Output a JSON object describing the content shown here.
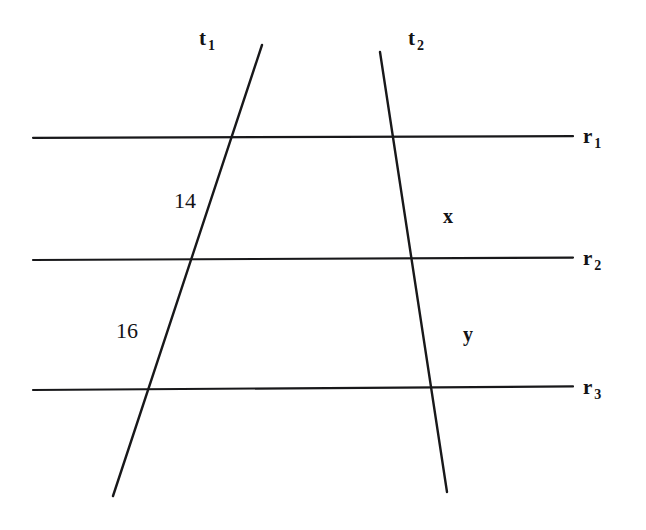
{
  "figure": {
    "background_color": "#ffffff",
    "stroke_color": "#18181a",
    "width": 646,
    "height": 530,
    "parallel_lines": [
      {
        "id": "r1",
        "label_base": "r",
        "label_sub": "1",
        "y": 137,
        "x_start": 33,
        "x_end": 573,
        "label_x": 583,
        "label_y": 126
      },
      {
        "id": "r2",
        "label_base": "r",
        "label_sub": "2",
        "y": 259,
        "x_start": 33,
        "x_end": 573,
        "label_x": 583,
        "label_y": 248
      },
      {
        "id": "r3",
        "label_base": "r",
        "label_sub": "3",
        "y": 388,
        "x_start": 33,
        "x_end": 573,
        "label_x": 583,
        "label_y": 377
      }
    ],
    "transversals": [
      {
        "id": "t1",
        "label_base": "t",
        "label_sub": "1",
        "x1": 262,
        "y1": 45,
        "x2": 113,
        "y2": 496,
        "label_x": 199,
        "label_y": 28
      },
      {
        "id": "t2",
        "label_base": "t",
        "label_sub": "2",
        "x1": 380,
        "y1": 52,
        "x2": 447,
        "y2": 492,
        "label_x": 408,
        "label_y": 28
      }
    ],
    "segment_labels": [
      {
        "id": "seg-14",
        "text": "14",
        "x": 174,
        "y": 190,
        "style": "number",
        "on_transversal": "t1",
        "between": [
          "r1",
          "r2"
        ]
      },
      {
        "id": "seg-16",
        "text": "16",
        "x": 116,
        "y": 320,
        "style": "number",
        "on_transversal": "t1",
        "between": [
          "r2",
          "r3"
        ]
      },
      {
        "id": "seg-x",
        "text": "x",
        "x": 443,
        "y": 206,
        "style": "variable",
        "on_transversal": "t2",
        "between": [
          "r1",
          "r2"
        ]
      },
      {
        "id": "seg-y",
        "text": "y",
        "x": 463,
        "y": 324,
        "style": "variable",
        "on_transversal": "t2",
        "between": [
          "r2",
          "r3"
        ]
      }
    ]
  }
}
